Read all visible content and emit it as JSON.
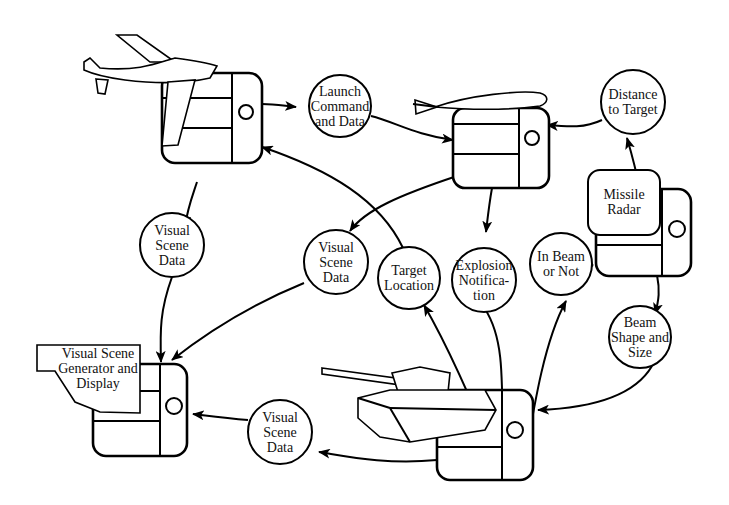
{
  "diagram": {
    "type": "distributed simulation data-flow diagram",
    "simulators": [
      {
        "id": "aircraft",
        "label": "",
        "icon": "airplane"
      },
      {
        "id": "missile",
        "label": "",
        "icon": "missile"
      },
      {
        "id": "radar",
        "label": "Missile Radar",
        "lines": [
          "Missile",
          "Radar"
        ]
      },
      {
        "id": "visual",
        "label": "Visual Scene Generator and Display",
        "lines": [
          "Visual Scene",
          "Generator and",
          "Display"
        ]
      },
      {
        "id": "tank",
        "label": "",
        "icon": "tank"
      }
    ],
    "messages": [
      {
        "id": "launch",
        "lines": [
          "Launch",
          "Command",
          "and Data"
        ],
        "from": "aircraft",
        "to": "missile"
      },
      {
        "id": "distance",
        "lines": [
          "Distance",
          "to Target"
        ],
        "from": "radar",
        "to": "missile"
      },
      {
        "id": "vsd_air",
        "lines": [
          "Visual",
          "Scene",
          "Data"
        ],
        "from": "aircraft",
        "to": "visual"
      },
      {
        "id": "vsd_missile",
        "lines": [
          "Visual",
          "Scene",
          "Data"
        ],
        "from": "missile",
        "to": "visual"
      },
      {
        "id": "target_loc",
        "lines": [
          "Target",
          "Location"
        ],
        "from": "tank",
        "to": "aircraft"
      },
      {
        "id": "explosion",
        "lines": [
          "Explosion",
          "Notifica-",
          "tion"
        ],
        "from": "missile",
        "to": "tank"
      },
      {
        "id": "inbeam",
        "lines": [
          "In Beam",
          "or Not"
        ],
        "from": "tank",
        "to": "radar"
      },
      {
        "id": "beam",
        "lines": [
          "Beam",
          "Shape and",
          "Size"
        ],
        "from": "radar",
        "to": "tank"
      },
      {
        "id": "vsd_tank",
        "lines": [
          "Visual",
          "Scene",
          "Data"
        ],
        "from": "tank",
        "to": "visual"
      }
    ]
  }
}
